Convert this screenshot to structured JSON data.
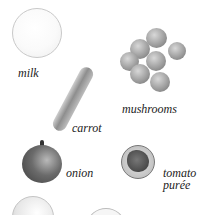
{
  "ingredients": [
    {
      "id": "milk",
      "label": "milk"
    },
    {
      "id": "carrot",
      "label": "carrot"
    },
    {
      "id": "mushrooms",
      "label": "mushrooms"
    },
    {
      "id": "onion",
      "label": "onion"
    },
    {
      "id": "tomato-puree",
      "label_line1": "tomato",
      "label_line2": "purée"
    }
  ]
}
